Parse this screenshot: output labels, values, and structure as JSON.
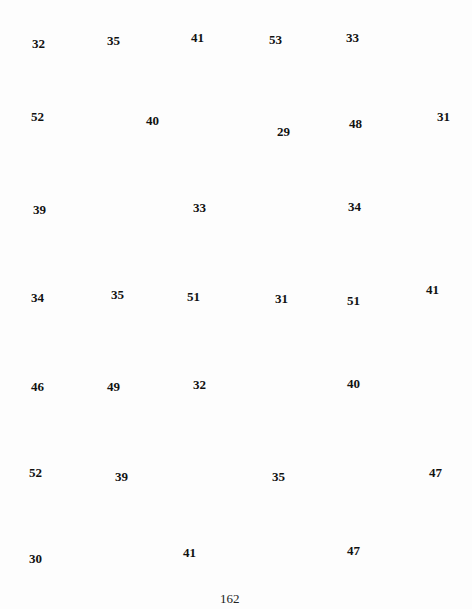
{
  "numbers": [
    {
      "value": "32",
      "x": 32,
      "y": 37
    },
    {
      "value": "35",
      "x": 107,
      "y": 34
    },
    {
      "value": "41",
      "x": 191,
      "y": 31
    },
    {
      "value": "53",
      "x": 269,
      "y": 33
    },
    {
      "value": "33",
      "x": 346,
      "y": 31
    },
    {
      "value": "52",
      "x": 31,
      "y": 110
    },
    {
      "value": "40",
      "x": 146,
      "y": 114
    },
    {
      "value": "29",
      "x": 277,
      "y": 125
    },
    {
      "value": "48",
      "x": 349,
      "y": 117
    },
    {
      "value": "31",
      "x": 437,
      "y": 110
    },
    {
      "value": "39",
      "x": 33,
      "y": 203
    },
    {
      "value": "33",
      "x": 193,
      "y": 201
    },
    {
      "value": "34",
      "x": 348,
      "y": 200
    },
    {
      "value": "34",
      "x": 31,
      "y": 291
    },
    {
      "value": "35",
      "x": 111,
      "y": 288
    },
    {
      "value": "51",
      "x": 187,
      "y": 290
    },
    {
      "value": "31",
      "x": 275,
      "y": 292
    },
    {
      "value": "51",
      "x": 347,
      "y": 294
    },
    {
      "value": "41",
      "x": 426,
      "y": 283
    },
    {
      "value": "46",
      "x": 31,
      "y": 380
    },
    {
      "value": "49",
      "x": 107,
      "y": 380
    },
    {
      "value": "32",
      "x": 193,
      "y": 378
    },
    {
      "value": "40",
      "x": 347,
      "y": 377
    },
    {
      "value": "52",
      "x": 29,
      "y": 466
    },
    {
      "value": "39",
      "x": 115,
      "y": 470
    },
    {
      "value": "35",
      "x": 272,
      "y": 470
    },
    {
      "value": "47",
      "x": 429,
      "y": 466
    },
    {
      "value": "30",
      "x": 29,
      "y": 552
    },
    {
      "value": "41",
      "x": 183,
      "y": 546
    },
    {
      "value": "47",
      "x": 347,
      "y": 544
    }
  ],
  "page_number": {
    "value": "162",
    "x": 220,
    "y": 592
  }
}
